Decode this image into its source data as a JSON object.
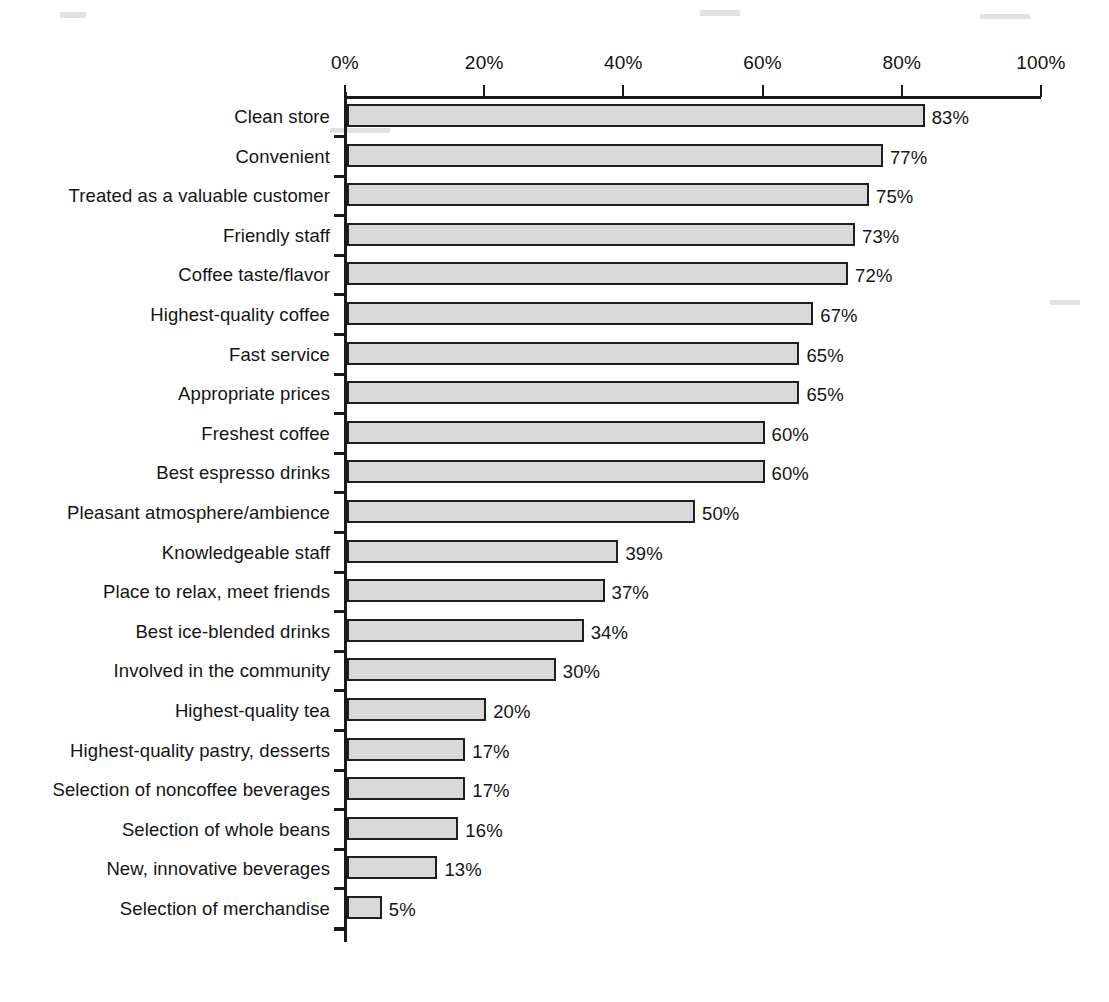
{
  "chart_data": {
    "type": "bar",
    "orientation": "horizontal",
    "title": "",
    "subtitle": "",
    "xlabel": "",
    "ylabel": "",
    "xlim": [
      0,
      100
    ],
    "grid": false,
    "legend": false,
    "value_suffix": "%",
    "axis_ticks": [
      "0%",
      "20%",
      "40%",
      "60%",
      "80%",
      "100%"
    ],
    "axis_tick_values": [
      0,
      20,
      40,
      60,
      80,
      100
    ],
    "categories": [
      "Clean store",
      "Convenient",
      "Treated as a valuable customer",
      "Friendly staff",
      "Coffee taste/flavor",
      "Highest-quality coffee",
      "Fast service",
      "Appropriate prices",
      "Freshest coffee",
      "Best espresso drinks",
      "Pleasant atmosphere/ambience",
      "Knowledgeable staff",
      "Place to relax, meet friends",
      "Best ice-blended drinks",
      "Involved in the community",
      "Highest-quality tea",
      "Highest-quality pastry, desserts",
      "Selection of noncoffee beverages",
      "Selection of whole beans",
      "New, innovative beverages",
      "Selection of merchandise"
    ],
    "values": [
      83,
      77,
      75,
      73,
      72,
      67,
      65,
      65,
      60,
      60,
      50,
      39,
      37,
      34,
      30,
      20,
      17,
      17,
      16,
      13,
      5
    ],
    "value_labels": [
      "83%",
      "77%",
      "75%",
      "73%",
      "72%",
      "67%",
      "65%",
      "65%",
      "60%",
      "60%",
      "50%",
      "39%",
      "37%",
      "34%",
      "30%",
      "20%",
      "17%",
      "17%",
      "16%",
      "13%",
      "5%"
    ],
    "colors": {
      "bar_fill": "#d9d9d9",
      "bar_border": "#1f1f1f",
      "axis": "#1a1a1a",
      "text": "#141414",
      "background": "#ffffff"
    }
  }
}
